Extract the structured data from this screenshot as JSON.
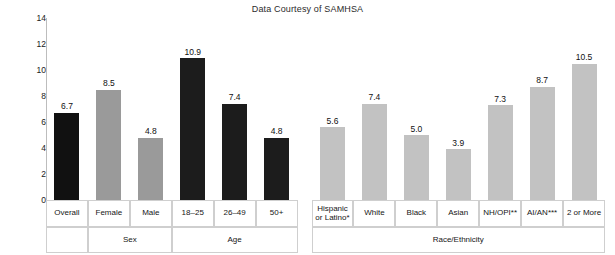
{
  "chart_data": {
    "type": "bar",
    "title": "Data Courtesy of SAMHSA",
    "xlabel": "",
    "ylabel": "Percent",
    "ylim": [
      0,
      14
    ],
    "yticks": [
      0,
      2,
      4,
      6,
      8,
      10,
      12,
      14
    ],
    "grid": false,
    "legend": "none",
    "categories": [
      "Overall",
      "Female",
      "Male",
      "18–25",
      "26–49",
      "50+",
      "Hispanic or Latino*",
      "White",
      "Black",
      "Asian",
      "NH/OPI**",
      "AI/AN***",
      "2 or More"
    ],
    "values": [
      6.7,
      8.5,
      4.8,
      10.9,
      7.4,
      4.8,
      5.6,
      7.4,
      5.0,
      3.9,
      7.3,
      8.7,
      10.5
    ],
    "value_labels": [
      "6.7",
      "8.5",
      "4.8",
      "10.9",
      "7.4",
      "4.8",
      "5.6",
      "7.4",
      "5.0",
      "3.9",
      "7.3",
      "8.7",
      "10.5"
    ],
    "bar_colors": [
      "#111111",
      "#9a9a9a",
      "#9a9a9a",
      "#1c1c1c",
      "#1c1c1c",
      "#1c1c1c",
      "#c2c2c2",
      "#c2c2c2",
      "#c2c2c2",
      "#c2c2c2",
      "#c2c2c2",
      "#c2c2c2",
      "#c2c2c2"
    ],
    "groups": [
      {
        "label": "",
        "categories": [
          "Overall"
        ]
      },
      {
        "label": "Sex",
        "categories": [
          "Female",
          "Male"
        ]
      },
      {
        "label": "Age",
        "categories": [
          "18–25",
          "26–49",
          "50+"
        ]
      },
      {
        "label": "Race/Ethnicity",
        "categories": [
          "Hispanic or Latino*",
          "White",
          "Black",
          "Asian",
          "NH/OPI**",
          "AI/AN***",
          "2 or More"
        ]
      }
    ]
  },
  "axis": {
    "ytick_labels": [
      "14",
      "12",
      "10",
      "8",
      "6",
      "4",
      "2",
      "0"
    ],
    "y_axis_title": "Percent"
  },
  "table": {
    "category_labels": [
      "Overall",
      "Female",
      "Male",
      "18–25",
      "26–49",
      "50+",
      "Hispanic\nor Latino*",
      "White",
      "Black",
      "Asian",
      "NH/OPI**",
      "AI/AN***",
      "2 or More"
    ],
    "group_labels": [
      "",
      "Sex",
      "Age",
      "Race/Ethnicity"
    ]
  },
  "colors": {
    "bar_dark": "#111111",
    "bar_mid": "#9a9a9a",
    "bar_light": "#c2c2c2",
    "axis": "#bdbdbd",
    "grid_border": "#cfcfcf",
    "text": "#161616"
  }
}
